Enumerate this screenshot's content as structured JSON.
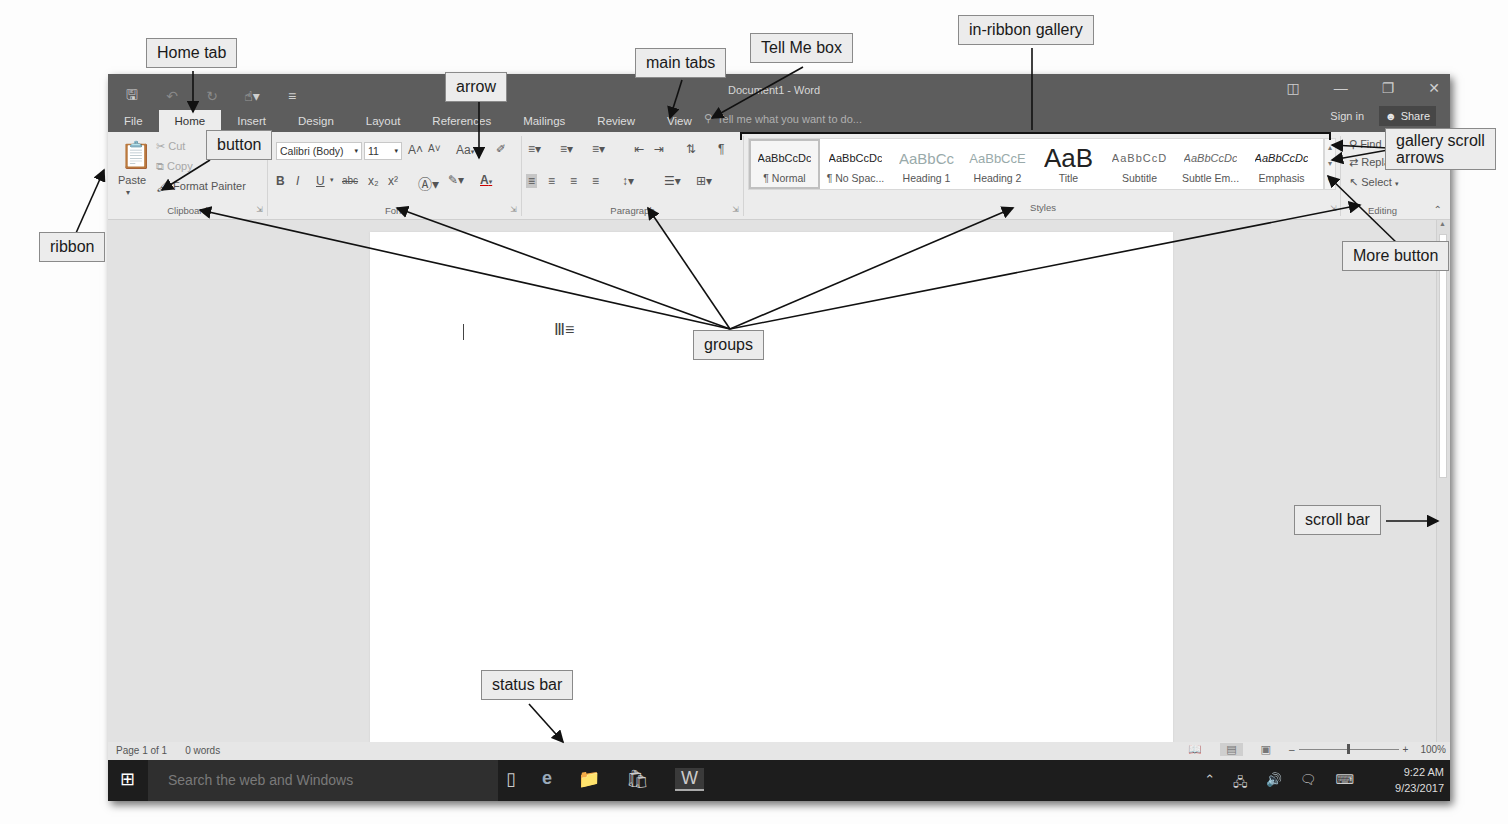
{
  "window": {
    "title": "Document1 - Word",
    "quick_access": [
      "save-icon",
      "undo-icon",
      "redo-icon",
      "touch-mode-icon",
      "customize-icon"
    ],
    "controls": [
      "ribbon-display-options",
      "minimize",
      "restore",
      "close"
    ],
    "sign_in": "Sign in",
    "share": "Share"
  },
  "tabs": [
    {
      "label": "File"
    },
    {
      "label": "Home",
      "active": true
    },
    {
      "label": "Insert"
    },
    {
      "label": "Design"
    },
    {
      "label": "Layout"
    },
    {
      "label": "References"
    },
    {
      "label": "Mailings"
    },
    {
      "label": "Review"
    },
    {
      "label": "View"
    }
  ],
  "tell_me": {
    "placeholder": "Tell me what you want to do..."
  },
  "ribbon": {
    "clipboard": {
      "label": "Clipboard",
      "paste": "Paste",
      "cut": "Cut",
      "copy": "Copy",
      "format_painter": "Format Painter"
    },
    "font": {
      "label": "Font",
      "font_name": "Calibri (Body)",
      "font_size": "11",
      "grow": "A˄",
      "shrink": "A˅",
      "change_case": "Aa",
      "bold": "B",
      "italic": "I",
      "underline": "U",
      "strikethrough": "abc",
      "subscript": "x₂",
      "superscript": "x²",
      "font_color": "A"
    },
    "paragraph": {
      "label": "Paragraph"
    },
    "styles": {
      "label": "Styles",
      "items": [
        {
          "preview": "AaBbCcDc",
          "name": "¶ Normal",
          "selected": true
        },
        {
          "preview": "AaBbCcDc",
          "name": "¶ No Spac..."
        },
        {
          "preview": "AaBbCc",
          "name": "Heading 1"
        },
        {
          "preview": "AaBbCcE",
          "name": "Heading 2"
        },
        {
          "preview": "AaB",
          "name": "Title"
        },
        {
          "preview": "AaBbCcD",
          "name": "Subtitle"
        },
        {
          "preview": "AaBbCcDc",
          "name": "Subtle Em..."
        },
        {
          "preview": "AaBbCcDc",
          "name": "Emphasis"
        }
      ]
    },
    "editing": {
      "label": "Editing",
      "find": "Find",
      "replace": "Replace",
      "select": "Select"
    }
  },
  "status_bar": {
    "page": "Page 1 of 1",
    "words": "0 words",
    "zoom": "100%"
  },
  "taskbar": {
    "search_placeholder": "Search the web and Windows",
    "time": "9:22 AM",
    "date": "9/23/2017"
  },
  "annotations": [
    {
      "id": "home-tab",
      "label": "Home tab"
    },
    {
      "id": "arrow",
      "label": "arrow"
    },
    {
      "id": "main-tabs",
      "label": "main tabs"
    },
    {
      "id": "tell-me-box",
      "label": "Tell Me box"
    },
    {
      "id": "in-ribbon-gallery",
      "label": "in-ribbon gallery"
    },
    {
      "id": "button",
      "label": "button"
    },
    {
      "id": "gallery-scroll-arrows",
      "label": "gallery scroll\narrows"
    },
    {
      "id": "ribbon",
      "label": "ribbon"
    },
    {
      "id": "more-button",
      "label": "More button"
    },
    {
      "id": "groups",
      "label": "groups"
    },
    {
      "id": "scroll-bar",
      "label": "scroll bar"
    },
    {
      "id": "status-bar",
      "label": "status bar"
    }
  ]
}
